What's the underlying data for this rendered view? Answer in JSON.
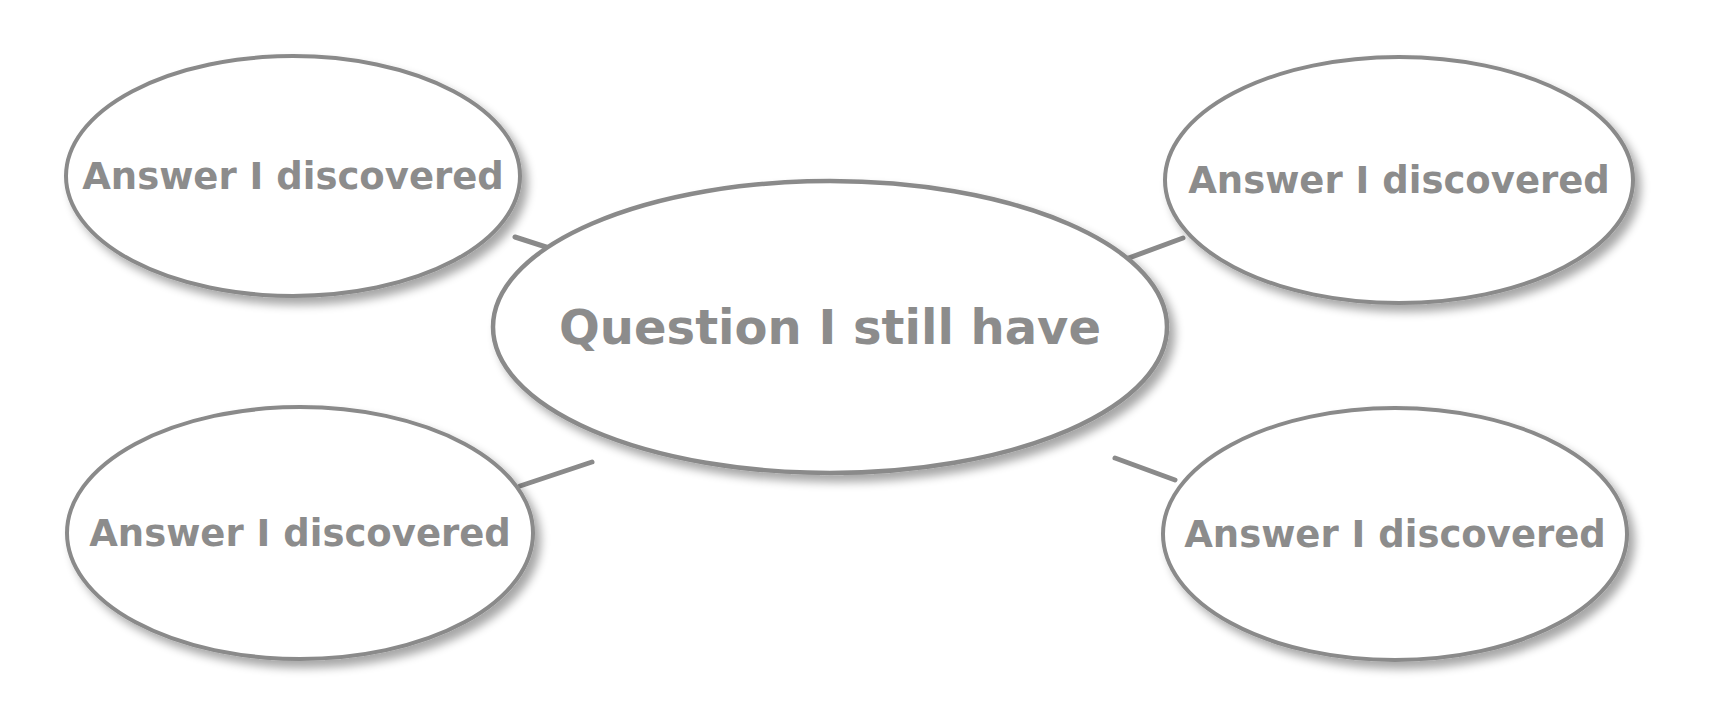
{
  "diagram": {
    "type": "graphic-organizer",
    "colors": {
      "background": "#ffffff",
      "node_fill": "#ffffff",
      "node_stroke": "#8a8a8a",
      "connector": "#8a8a8a",
      "text": "#8c8c8c",
      "shadow": "#9a9a9a"
    },
    "center": {
      "label": "Question I still have",
      "cx": 830,
      "cy": 327,
      "rx": 337,
      "ry": 146,
      "font_size": 48
    },
    "nodes": [
      {
        "id": "top-left",
        "label": "Answer I discovered",
        "cx": 293,
        "cy": 176,
        "rx": 227,
        "ry": 120,
        "font_size": 37
      },
      {
        "id": "top-right",
        "label": "Answer I discovered",
        "cx": 1399,
        "cy": 180,
        "rx": 234,
        "ry": 123,
        "font_size": 37
      },
      {
        "id": "bottom-left",
        "label": "Answer I discovered",
        "cx": 300,
        "cy": 533,
        "rx": 233,
        "ry": 126,
        "font_size": 37
      },
      {
        "id": "bottom-right",
        "label": "Answer I discovered",
        "cx": 1395,
        "cy": 534,
        "rx": 232,
        "ry": 126,
        "font_size": 37
      }
    ],
    "connectors": [
      {
        "from": "top-left",
        "x1": 515,
        "y1": 237,
        "x2": 580,
        "y2": 258
      },
      {
        "from": "top-right",
        "x1": 1183,
        "y1": 238,
        "x2": 1118,
        "y2": 262
      },
      {
        "from": "bottom-left",
        "x1": 520,
        "y1": 486,
        "x2": 592,
        "y2": 462
      },
      {
        "from": "bottom-right",
        "x1": 1175,
        "y1": 480,
        "x2": 1115,
        "y2": 458
      }
    ]
  }
}
